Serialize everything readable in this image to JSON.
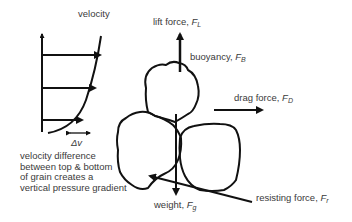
{
  "diagram": {
    "labels": {
      "velocity": "velocity",
      "delta_v": "Δv",
      "velocity_difference": [
        "velocity difference",
        "between top & bottom",
        "of grain creates a",
        "vertical pressure gradient"
      ],
      "lift_force": {
        "text": "lift force, ",
        "symbol": "F",
        "sub": "L"
      },
      "buoyancy": {
        "text": "buoyancy, ",
        "symbol": "F",
        "sub": "B"
      },
      "drag_force": {
        "text": "drag force, ",
        "symbol": "F",
        "sub": "D"
      },
      "weight": {
        "text": "weight, ",
        "symbol": "F",
        "sub": "g"
      },
      "resisting_force": {
        "text": "resisting force, ",
        "symbol": "F",
        "sub": "r"
      }
    },
    "colors": {
      "stroke": "#111111",
      "text": "#3a3a3a",
      "background": "#ffffff"
    }
  }
}
